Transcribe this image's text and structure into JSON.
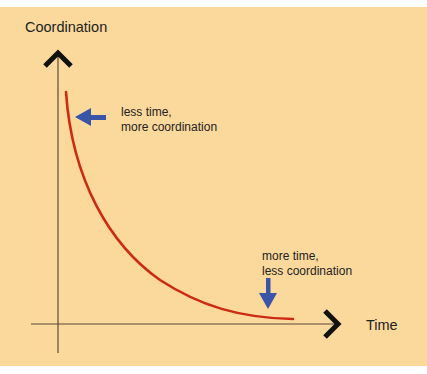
{
  "diagram": {
    "background_color": "#fbd99c",
    "axis_color": "#5a4a3a",
    "curve_color": "#cc2a12",
    "arrow_color": "#3a55a8",
    "y_axis_label": "Coordination",
    "x_axis_label": "Time",
    "annotations": [
      {
        "line1": "less time,",
        "line2": "more coordination"
      },
      {
        "line1": "more time,",
        "line2": "less coordination"
      }
    ]
  }
}
